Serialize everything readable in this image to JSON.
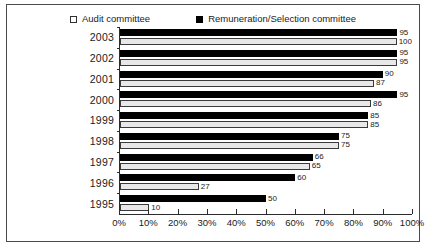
{
  "chart_data": {
    "type": "bar",
    "orientation": "horizontal",
    "title": "",
    "xlabel": "",
    "ylabel": "",
    "xlim": [
      0,
      100
    ],
    "xtick_labels": [
      "0%",
      "10%",
      "20%",
      "30%",
      "40%",
      "50%",
      "60%",
      "70%",
      "80%",
      "90%",
      "100%"
    ],
    "xtick_values": [
      0,
      10,
      20,
      30,
      40,
      50,
      60,
      70,
      80,
      90,
      100
    ],
    "grid": false,
    "legend_position": "top-center",
    "categories": [
      "2003",
      "2002",
      "2001",
      "2000",
      "1999",
      "1998",
      "1997",
      "1996",
      "1995"
    ],
    "series": [
      {
        "name": "Audit committee",
        "marker": "open-square",
        "color": "#e8e8e8",
        "values": [
          100,
          95,
          87,
          86,
          85,
          75,
          65,
          27,
          10
        ]
      },
      {
        "name": "Remuneration/Selection committee",
        "marker": "filled-square",
        "color": "#000000",
        "values": [
          95,
          95,
          90,
          95,
          85,
          75,
          66,
          60,
          50
        ]
      }
    ]
  },
  "legend": {
    "entries": [
      {
        "label": "Audit committee"
      },
      {
        "label": "Remuneration/Selection committee"
      }
    ]
  }
}
